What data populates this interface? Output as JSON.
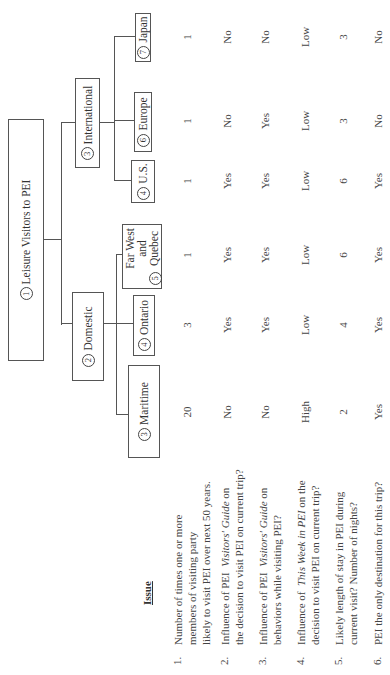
{
  "tree": {
    "root": {
      "number": "1",
      "label": "Leisure Visitors to PEI"
    },
    "domestic": {
      "number": "2",
      "label": "Domestic"
    },
    "international": {
      "number": "3",
      "label": "International"
    },
    "maritime": {
      "number": "3",
      "label": "Maritime"
    },
    "ontario": {
      "number": "4",
      "label": "Ontario"
    },
    "farwest": {
      "number": "5",
      "label_line1": "Far  West",
      "label_line2": "and",
      "label_line3": "Quebec"
    },
    "us": {
      "number": "4",
      "label": "U.S."
    },
    "europe": {
      "number": "6",
      "label": "Europe"
    },
    "japan": {
      "number": "7",
      "label": "Japan"
    }
  },
  "table": {
    "header": "Issue",
    "columns": [
      "Maritime",
      "Ontario",
      "Far West and Quebec",
      "U.S.",
      "Europe",
      "Japan"
    ],
    "rows": [
      {
        "number": "1.",
        "lines": [
          "Number of times one or more",
          "members of visiting party",
          "likely to visit PEI over next 50 years."
        ],
        "values": [
          "20",
          "3",
          "1",
          "1",
          "1",
          "1"
        ]
      },
      {
        "number": "2.",
        "line1_pre": "Influence of PEI ",
        "line1_italic": "Visitors' Guide",
        "line1_post": " on",
        "line2": "the decision to visit PEI on current trip?",
        "values": [
          "No",
          "Yes",
          "Yes",
          "Yes",
          "No",
          "No"
        ]
      },
      {
        "number": "3.",
        "line1_pre": "Influence of PEI ",
        "line1_italic": "Visitors' Guide",
        "line1_post": " on",
        "line2": "behaviors while visiting PEI?",
        "values": [
          "No",
          "Yes",
          "Yes",
          "Yes",
          "Yes",
          "No"
        ]
      },
      {
        "number": "4.",
        "line1_pre": "Influence of ",
        "line1_italic": "This Week in PEI",
        "line1_post": " on the",
        "line2": "decision to visit PEI on current trip?",
        "values": [
          "High",
          "Low",
          "Low",
          "Low",
          "Low",
          "Low"
        ]
      },
      {
        "number": "5.",
        "lines": [
          "Likely length of stay in PEI during",
          "current visit? Number of nights?"
        ],
        "values": [
          "2",
          "4",
          "6",
          "6",
          "3",
          "3"
        ]
      },
      {
        "number": "6.",
        "lines": [
          "PEI  the only destination for this trip?"
        ],
        "values": [
          "Yes",
          "Yes",
          "Yes",
          "Yes",
          "No",
          "No"
        ]
      }
    ]
  }
}
